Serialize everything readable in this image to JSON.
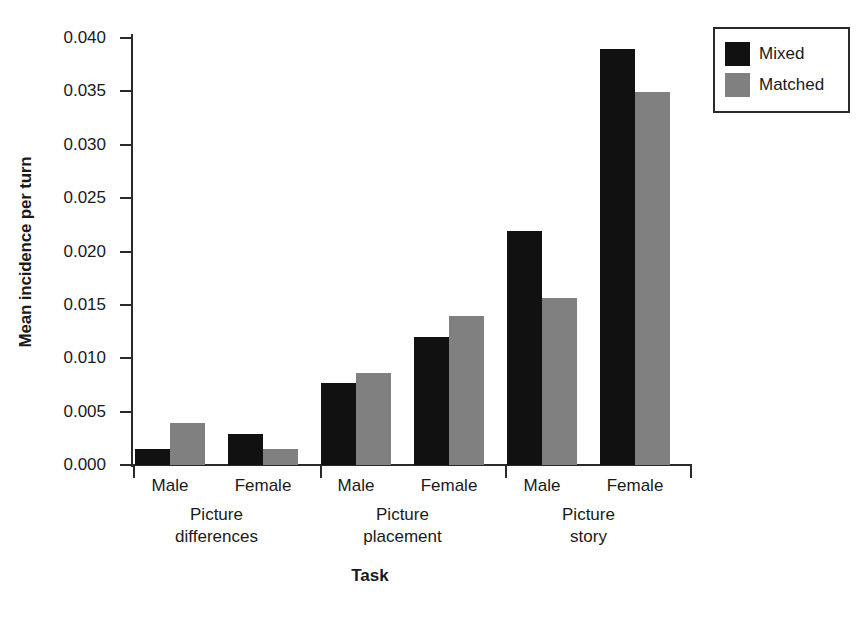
{
  "chart_data": {
    "type": "bar",
    "title": "",
    "xlabel": "Task",
    "ylabel": "Mean incidence per turn",
    "ylim": [
      0.0,
      0.04
    ],
    "ytick_labels": [
      "0.040",
      "0.035",
      "0.030",
      "0.025",
      "0.020",
      "0.015",
      "0.010",
      "0.005",
      "0.000"
    ],
    "ytick_values": [
      0.04,
      0.035,
      0.03,
      0.025,
      0.02,
      0.015,
      0.01,
      0.005,
      0.0
    ],
    "grid": false,
    "legend_position": "top-right",
    "categories": [
      "Male",
      "Female",
      "Male",
      "Female",
      "Male",
      "Female"
    ],
    "groups": [
      {
        "name": "Picture differences",
        "line1": "Picture",
        "line2": "differences",
        "subcategories": [
          "Male",
          "Female"
        ]
      },
      {
        "name": "Picture placement",
        "line1": "Picture",
        "line2": "placement",
        "subcategories": [
          "Male",
          "Female"
        ]
      },
      {
        "name": "Picture story",
        "line1": "Picture",
        "line2": "story",
        "subcategories": [
          "Male",
          "Female"
        ]
      }
    ],
    "series": [
      {
        "name": "Mixed",
        "color": "#111111",
        "values": [
          0.0015,
          0.0029,
          0.0077,
          0.012,
          0.0219,
          0.039
        ]
      },
      {
        "name": "Matched",
        "color": "#808080",
        "values": [
          0.0039,
          0.0015,
          0.0086,
          0.014,
          0.0156,
          0.0349
        ]
      }
    ]
  },
  "legend": {
    "entries": [
      {
        "label": "Mixed"
      },
      {
        "label": "Matched"
      }
    ]
  },
  "colors": {
    "mixed": "#111111",
    "matched": "#808080",
    "axis": "#2a2a2a",
    "background": "#ffffff"
  }
}
